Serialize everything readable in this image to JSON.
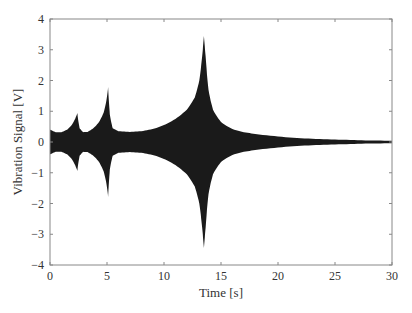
{
  "chart_data": {
    "type": "area",
    "title": "",
    "xlabel": "Time [s]",
    "ylabel": "Vibration Signal [V]",
    "xlim": [
      0,
      30
    ],
    "ylim": [
      -4,
      4
    ],
    "xticks": [
      0,
      5,
      10,
      15,
      20,
      25,
      30
    ],
    "yticks": [
      4,
      3,
      2,
      1,
      0,
      -1,
      -2,
      -3,
      -4
    ],
    "grid": false,
    "legend": null,
    "color": "#1a1a1a",
    "series": [
      {
        "name": "Vibration Signal envelope (upper, symmetric about 0)",
        "x": [
          0.0,
          0.5,
          1.0,
          1.5,
          1.9,
          2.2,
          2.4,
          2.6,
          2.9,
          3.3,
          3.8,
          4.3,
          4.7,
          4.95,
          5.1,
          5.25,
          5.5,
          6.0,
          7.0,
          8.0,
          9.0,
          10.0,
          11.0,
          12.0,
          12.7,
          13.1,
          13.35,
          13.5,
          13.65,
          13.9,
          14.3,
          15.0,
          16.0,
          17.0,
          18.0,
          20.0,
          22.0,
          24.0,
          26.0,
          28.0,
          30.0
        ],
        "values": [
          0.4,
          0.32,
          0.32,
          0.4,
          0.55,
          0.75,
          0.94,
          0.45,
          0.32,
          0.33,
          0.45,
          0.65,
          0.95,
          1.35,
          1.79,
          0.9,
          0.45,
          0.35,
          0.33,
          0.35,
          0.42,
          0.55,
          0.75,
          1.05,
          1.45,
          2.0,
          2.8,
          3.45,
          2.8,
          1.7,
          1.05,
          0.65,
          0.42,
          0.32,
          0.26,
          0.18,
          0.12,
          0.09,
          0.07,
          0.05,
          0.04
        ]
      }
    ],
    "annotations": [
      {
        "label": "peak 1",
        "x": 2.4,
        "y": 0.94
      },
      {
        "label": "peak 2",
        "x": 5.1,
        "y": 1.79
      },
      {
        "label": "peak 3",
        "x": 13.5,
        "y": 3.45
      }
    ]
  }
}
